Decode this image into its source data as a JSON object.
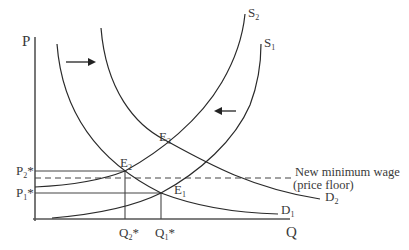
{
  "diagram": {
    "type": "supply-demand",
    "axes": {
      "y_label": "P",
      "x_label": "Q"
    },
    "price_labels": {
      "p2": {
        "main": "P",
        "sub": "2",
        "star": "*"
      },
      "p1": {
        "main": "P",
        "sub": "1",
        "star": "*"
      }
    },
    "quantity_labels": {
      "q2": {
        "main": "Q",
        "sub": "2",
        "star": "*"
      },
      "q1": {
        "main": "Q",
        "sub": "1",
        "star": "*"
      }
    },
    "curves": {
      "s1": {
        "main": "S",
        "sub": "1"
      },
      "s2": {
        "main": "S",
        "sub": "2"
      },
      "d1": {
        "main": "D",
        "sub": "1"
      },
      "d2": {
        "main": "D",
        "sub": "2"
      }
    },
    "equilibria": {
      "e1": {
        "main": "E",
        "sub": "1"
      },
      "e2": {
        "main": "E",
        "sub": "2"
      },
      "e3": {
        "main": "E",
        "sub": "3"
      }
    },
    "annotation": {
      "line1": "New minimum wage",
      "line2": "(price floor)"
    },
    "arrows": {
      "demand_shift": "right",
      "supply_shift": "left"
    },
    "colors": {
      "axis": "#555555",
      "curve": "#2a2a2a",
      "text": "#3a3a3a"
    }
  }
}
